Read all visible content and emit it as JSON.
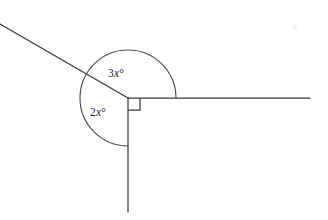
{
  "figure": {
    "background_color": "#ffffff",
    "line_color": "#3b3b3b",
    "arc_color": "#4a4a4a",
    "label_color": "#262626",
    "width": 328,
    "height": 220
  },
  "vertex": {
    "x": 128,
    "y": 98
  },
  "rays": [
    {
      "name": "diagonal-upper-left-ray",
      "from_x": 128,
      "from_y": 98,
      "to_x": 0,
      "to_y": 24
    },
    {
      "name": "horizontal-right-ray",
      "from_x": 128,
      "from_y": 98,
      "to_x": 310,
      "to_y": 98
    },
    {
      "name": "vertical-down-ray",
      "from_x": 128,
      "from_y": 98,
      "to_x": 128,
      "to_y": 212
    }
  ],
  "arc": {
    "name": "reflex-angle-arc",
    "radius": 48,
    "start_angle_deg": 0,
    "end_angle_deg": 270,
    "path": "M 176 98 A 48 48 0 1 0 128 146"
  },
  "right_angle_marker": {
    "name": "right-angle-square",
    "size": 12,
    "path": "M 128 110 L 140 110 L 140 98"
  },
  "labels": {
    "upper_angle": {
      "coefficient": "3",
      "variable": "x",
      "degree_symbol": "°",
      "full_text": "3x°"
    },
    "lower_angle": {
      "coefficient": "2",
      "variable": "x",
      "degree_symbol": "°",
      "full_text": "2x°"
    }
  }
}
